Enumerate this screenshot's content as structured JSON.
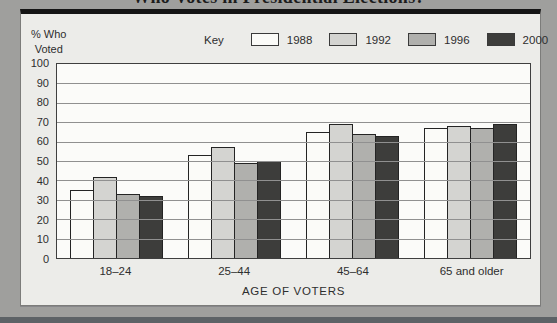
{
  "title": "Who Votes in Presidential Elections?",
  "y_axis_title": "% Who\nVoted",
  "legend": {
    "title": "Key"
  },
  "colors": {
    "series": [
      "#fbfbf8",
      "#d4d4d1",
      "#b0b0ad",
      "#3d3d3b"
    ]
  },
  "chart_data": {
    "type": "bar",
    "title": "Who Votes in Presidential Elections?",
    "categories": [
      "18–24",
      "25–44",
      "45–64",
      "65 and older"
    ],
    "series": [
      {
        "name": "1988",
        "values": [
          35,
          53,
          65,
          67
        ]
      },
      {
        "name": "1992",
        "values": [
          42,
          57,
          69,
          68
        ]
      },
      {
        "name": "1996",
        "values": [
          33,
          49,
          64,
          67
        ]
      },
      {
        "name": "2000",
        "values": [
          32,
          50,
          63,
          69
        ]
      }
    ],
    "xlabel": "AGE OF VOTERS",
    "ylabel": "% Who Voted",
    "ylim": [
      0,
      100
    ],
    "yticks": [
      0,
      10,
      20,
      30,
      40,
      50,
      60,
      70,
      80,
      90,
      100
    ],
    "grid": true,
    "legend_position": "top"
  }
}
